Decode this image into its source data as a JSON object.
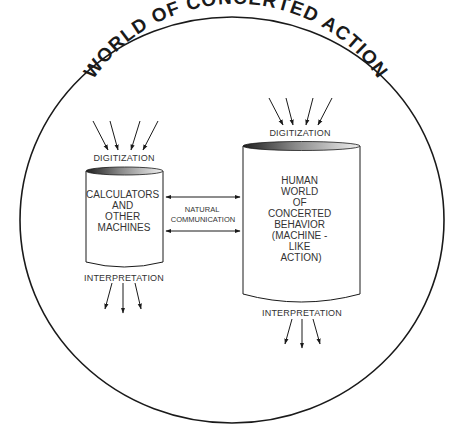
{
  "title": "WORLD OF CONCERTED ACTION",
  "left_cylinder": {
    "top_label": "DIGITIZATION",
    "lines": [
      "CALCULATORS",
      "AND",
      "OTHER",
      "MACHINES"
    ],
    "bottom_label": "INTERPRETATION"
  },
  "right_cylinder": {
    "top_label": "DIGITIZATION",
    "lines": [
      "HUMAN",
      "WORLD",
      "OF",
      "CONCERTED",
      "BEHAVIOR",
      "(MACHINE -",
      "LIKE",
      "ACTION)"
    ],
    "bottom_label": "INTERPRETATION"
  },
  "link": {
    "lines": [
      "NATURAL",
      "COMMUNICATION"
    ]
  },
  "colors": {
    "stroke": "#1a1a1a",
    "text": "#333333",
    "cap_dark": "#222222",
    "cap_light": "#e8e8e8"
  }
}
